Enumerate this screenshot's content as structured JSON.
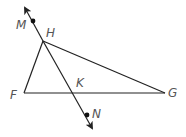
{
  "diagram": {
    "type": "geometry",
    "stroke_color": "#222222",
    "label_color": "#555555",
    "points": {
      "M": {
        "label": "M",
        "x": 33,
        "y": 20
      },
      "H": {
        "label": "H",
        "x": 43,
        "y": 41
      },
      "F": {
        "label": "F",
        "x": 24,
        "y": 93
      },
      "G": {
        "label": "G",
        "x": 165,
        "y": 93
      },
      "K": {
        "label": "K",
        "x": 74,
        "y": 93
      },
      "N": {
        "label": "N",
        "x": 87,
        "y": 115
      }
    },
    "segments": [
      {
        "from": "F",
        "to": "H"
      },
      {
        "from": "H",
        "to": "G"
      },
      {
        "from": "F",
        "to": "G"
      }
    ],
    "lines": [
      {
        "name": "MN",
        "through": [
          "M",
          "H",
          "K",
          "N"
        ],
        "arrows": "both"
      }
    ],
    "labels": {
      "M": "M",
      "H": "H",
      "F": "F",
      "G": "G",
      "K": "K",
      "N": "N"
    }
  }
}
